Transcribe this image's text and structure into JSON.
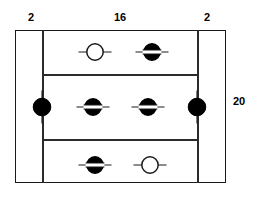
{
  "diagram": {
    "stroke_color": "#1a1a1a",
    "fill_color": "#000000",
    "background_color": "#ffffff"
  },
  "dimensions": {
    "left_margin": "2",
    "center_span": "16",
    "right_margin": "2",
    "height": "20"
  },
  "plate": {
    "outline_name": "plate-outline",
    "vertical_dividers": 2,
    "horizontal_dividers": 2,
    "rows": 3
  },
  "fasteners": [
    {
      "id": "edge-left-mid",
      "type": "solid-circle",
      "symbol": "filled rivet",
      "x": 42,
      "y": 107,
      "stub": "vertical"
    },
    {
      "id": "edge-right-mid",
      "type": "solid-circle",
      "symbol": "filled rivet",
      "x": 197,
      "y": 107,
      "stub": "vertical"
    },
    {
      "id": "row1-left",
      "type": "open-circle",
      "symbol": "open rivet",
      "x": 95,
      "y": 52,
      "stub": "horizontal"
    },
    {
      "id": "row1-right",
      "type": "banded-circle",
      "symbol": "filled rivet with slot",
      "x": 152,
      "y": 52,
      "stub": "horizontal"
    },
    {
      "id": "row2-left",
      "type": "banded-circle",
      "symbol": "filled rivet with slot",
      "x": 93,
      "y": 107,
      "stub": "horizontal"
    },
    {
      "id": "row2-right",
      "type": "banded-circle",
      "symbol": "filled rivet with slot",
      "x": 148,
      "y": 107,
      "stub": "horizontal"
    },
    {
      "id": "row3-left",
      "type": "banded-circle",
      "symbol": "filled rivet with slot",
      "x": 95,
      "y": 165,
      "stub": "horizontal"
    },
    {
      "id": "row3-right",
      "type": "open-circle",
      "symbol": "open rivet",
      "x": 150,
      "y": 165,
      "stub": "horizontal"
    }
  ]
}
